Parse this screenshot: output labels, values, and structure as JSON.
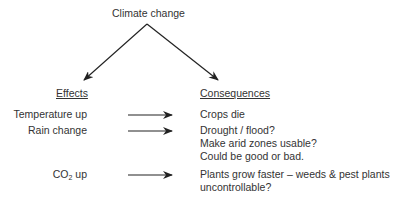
{
  "title": "Climate change",
  "headers": {
    "effects": "Effects",
    "consequences": "Consequences"
  },
  "rows": [
    {
      "effect": "Temperature up",
      "consequence_lines": [
        "Crops die"
      ]
    },
    {
      "effect": "Rain change",
      "consequence_lines": [
        "Drought / flood?",
        "Make arid zones usable?",
        "Could be good or bad."
      ]
    },
    {
      "effect_main": "CO",
      "effect_sub": "2",
      "effect_tail": " up",
      "consequence_lines": [
        "Plants grow faster – weeds & pest plants",
        "uncontrollable?"
      ]
    }
  ],
  "colors": {
    "text": "#333333",
    "arrow": "#222222"
  }
}
